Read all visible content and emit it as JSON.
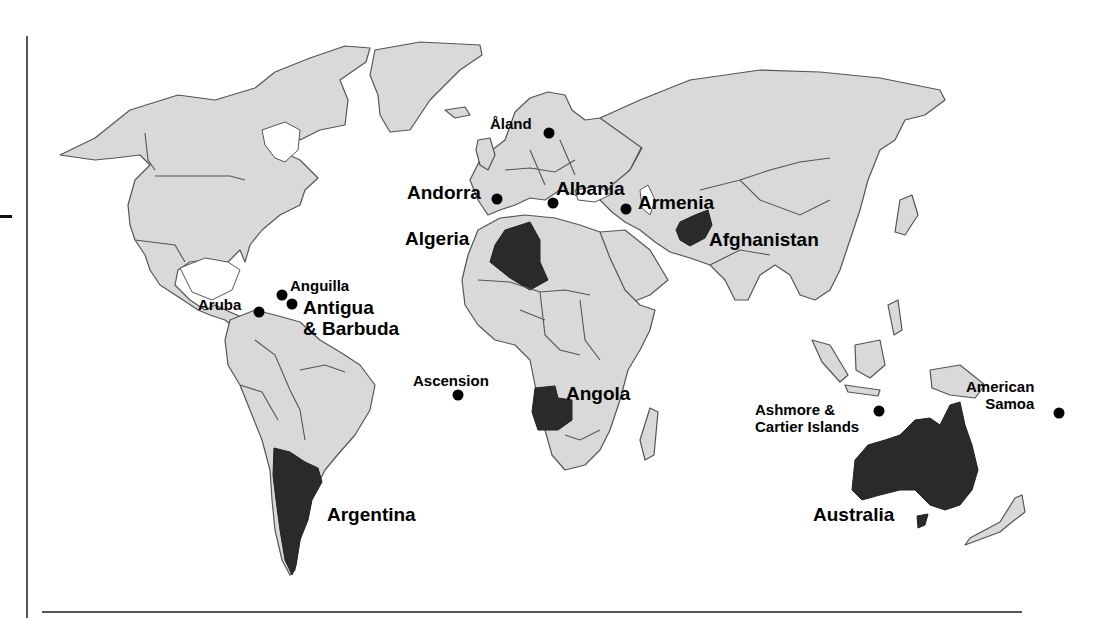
{
  "map": {
    "title": "",
    "colors": {
      "land": "#d9d9d9",
      "highlight": "#2a2a2a",
      "border": "#555555",
      "marker": "#000000",
      "background": "#ffffff"
    },
    "highlighted_countries": [
      {
        "name": "Algeria"
      },
      {
        "name": "Afghanistan"
      },
      {
        "name": "Angola"
      },
      {
        "name": "Argentina"
      },
      {
        "name": "Australia"
      }
    ],
    "labels": {
      "aland": "Åland",
      "andorra": "Andorra",
      "albania": "Albania",
      "armenia": "Armenia",
      "algeria": "Algeria",
      "afghanistan": "Afghanistan",
      "anguilla": "Anguilla",
      "aruba": "Aruba",
      "antigua": "Antigua\n& Barbuda",
      "ascension": "Ascension",
      "angola": "Angola",
      "argentina": "Argentina",
      "ashmore": "Ashmore &\nCartier Islands",
      "american_samoa": "American\nSamoa",
      "australia": "Australia"
    },
    "markers": [
      {
        "name": "Åland",
        "x": 549,
        "y": 133
      },
      {
        "name": "Andorra",
        "x": 497,
        "y": 199
      },
      {
        "name": "Albania",
        "x": 553,
        "y": 203
      },
      {
        "name": "Armenia",
        "x": 626,
        "y": 209
      },
      {
        "name": "Anguilla",
        "x": 282,
        "y": 295
      },
      {
        "name": "Antigua & Barbuda",
        "x": 292,
        "y": 304
      },
      {
        "name": "Aruba",
        "x": 259,
        "y": 312
      },
      {
        "name": "Ascension",
        "x": 458,
        "y": 395
      },
      {
        "name": "Ashmore & Cartier Islands",
        "x": 879,
        "y": 411
      },
      {
        "name": "American Samoa",
        "x": 1059,
        "y": 413
      }
    ]
  }
}
